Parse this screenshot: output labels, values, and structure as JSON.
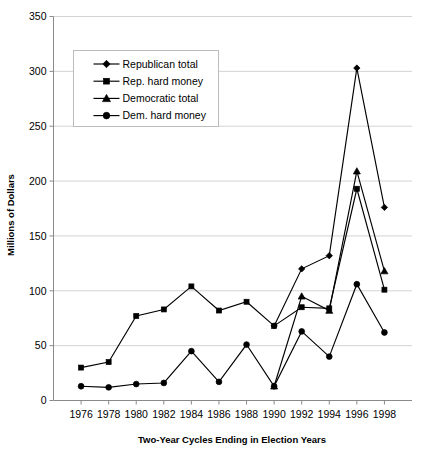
{
  "chart_data": {
    "type": "line",
    "title": "",
    "xlabel": "Two-Year Cycles Ending in Election Years",
    "ylabel": "Millions of Dollars",
    "categories": [
      "1976",
      "1978",
      "1980",
      "1982",
      "1984",
      "1986",
      "1988",
      "1990",
      "1992",
      "1994",
      "1996",
      "1998"
    ],
    "xticklabels": [
      "1976",
      "1978",
      "1980",
      "1982",
      "1984",
      "1986",
      "1988",
      "1990",
      "1992",
      "1994",
      "1996",
      "1998"
    ],
    "yticklabels": [
      "0",
      "50",
      "100",
      "150",
      "200",
      "250",
      "300",
      "350"
    ],
    "ylim": [
      0,
      350
    ],
    "ytick_step": 50,
    "grid": "horizontal",
    "legend_position": "top-left-inside",
    "series": [
      {
        "name": "Republican total",
        "marker": "diamond",
        "values": [
          null,
          null,
          null,
          null,
          null,
          null,
          null,
          68,
          120,
          132,
          303,
          176
        ]
      },
      {
        "name": "Rep. hard money",
        "marker": "square",
        "values": [
          30,
          35,
          77,
          83,
          104,
          82,
          90,
          68,
          85,
          84,
          193,
          101
        ]
      },
      {
        "name": "Democratic total",
        "marker": "triangle",
        "values": [
          null,
          null,
          null,
          null,
          null,
          null,
          null,
          13,
          95,
          82,
          209,
          118
        ]
      },
      {
        "name": "Dem. hard money",
        "marker": "circle",
        "values": [
          13,
          12,
          15,
          16,
          45,
          17,
          51,
          13,
          63,
          40,
          106,
          62
        ]
      }
    ]
  },
  "legend": {
    "entries": [
      {
        "label": "Republican total",
        "marker": "diamond"
      },
      {
        "label": "Rep. hard money",
        "marker": "square"
      },
      {
        "label": "Democratic total",
        "marker": "triangle"
      },
      {
        "label": "Dem. hard money",
        "marker": "circle"
      }
    ]
  },
  "colors": {
    "series": "#000000",
    "gridline": "#c8c8c8",
    "axis": "#8a8a8a",
    "background": "#ffffff"
  }
}
